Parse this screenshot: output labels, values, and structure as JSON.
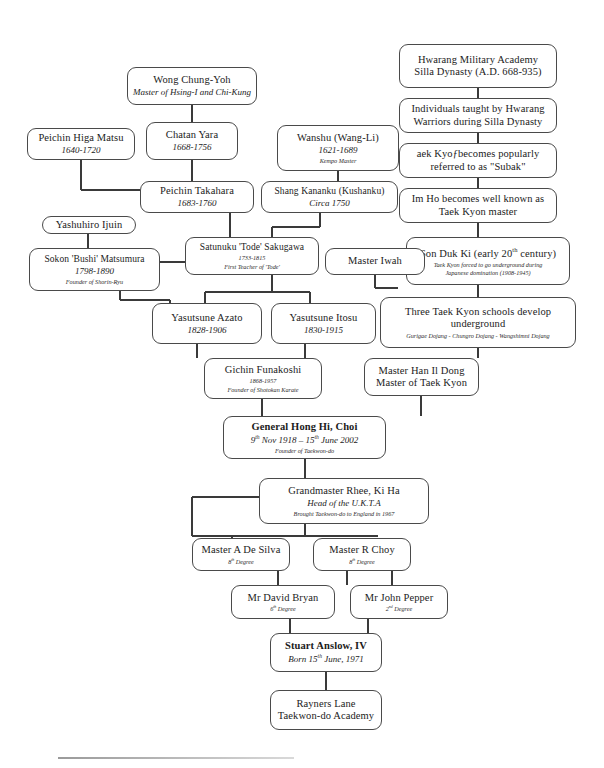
{
  "document": {
    "title": "Taekwon-do Lineage Chart",
    "type": "lineage-tree"
  },
  "nodes": {
    "hwarang_academy": {
      "line1": "Hwarang Military Academy",
      "line2": "Silla Dynasty (A.D. 668-935)"
    },
    "individuals_taught": {
      "line1": "Individuals taught by Hwarang",
      "line2": "Warriors during Silla Dynasty"
    },
    "subak": {
      "line1": "aek Kyoƒbecomes popularly",
      "line2": "referred to as \"Subak\""
    },
    "im_ho": {
      "line1": "Im Ho becomes well known as",
      "line2": "Taek Kyon master"
    },
    "son_duk_ki": {
      "line1": "Son Duk Ki (early 20th century)",
      "line2": "Taek Kyon forced to go underground during",
      "line3": "Japanese domination  (1908-1945)"
    },
    "three_schools": {
      "line1": "Three Taek Kyon schools develop",
      "line2": "underground",
      "line3": "Gurigae Dojang - Chungro Dojang - Wangshimni Dojang"
    },
    "han_il_dong": {
      "line1": "Master Han Il Dong",
      "line2": "Master of Taek Kyon"
    },
    "wong_chung_yoh": {
      "line1": "Wong Chung-Yoh",
      "line2": "Master of Hsing-I and Chi-Kung"
    },
    "higa_matsu": {
      "line1": "Peichin Higa Matsu",
      "line2": "1640-1720"
    },
    "chatan_yara": {
      "line1": "Chatan Yara",
      "line2": "1668-1756"
    },
    "wanshu": {
      "line1": "Wanshu (Wang-Li)",
      "line2": "1621-1689",
      "line3": "Kempo Master"
    },
    "takahara": {
      "line1": "Peichin Takahara",
      "line2": "1683-1760"
    },
    "shang_kananku": {
      "line1": "Shang Kananku (Kushanku)",
      "line2": "Circa 1750"
    },
    "yashuhiro_ijuin": {
      "line1": "Yashuhiro Ijuin"
    },
    "sakugawa": {
      "line1": "Satunuku 'Tode' Sakugawa",
      "line2": "1733-1815",
      "line3": "First Teacher of 'Tode'"
    },
    "master_iwah": {
      "line1": "Master Iwah"
    },
    "matsumura": {
      "line1": "Sokon 'Bushi' Matsumura",
      "line2": "1798-1890",
      "line3": "Founder of Shorin-Ryu"
    },
    "azato": {
      "line1": "Yasutsune Azato",
      "line2": "1828-1906"
    },
    "itosu": {
      "line1": "Yasutsune Itosu",
      "line2": "1830-1915"
    },
    "funakoshi": {
      "line1": "Gichin Funakoshi",
      "line2": "1868-1957",
      "line3": "Founder of Shotokan Karate"
    },
    "general_choi": {
      "line1": "General Hong Hi, Choi",
      "line2": "9th Nov 1918 – 15th June 2002",
      "line3": "Founder of Taekwon-do"
    },
    "rhee_ki_ha": {
      "line1": "Grandmaster Rhee, Ki Ha",
      "line2": "Head of the U.K.T.A",
      "line3": "Brought Taekwon-do to England in 1967"
    },
    "de_silva": {
      "line1": "Master A De Silva",
      "line2": "8th Degree"
    },
    "r_choy": {
      "line1": "Master R Choy",
      "line2": "8th Degree"
    },
    "david_bryan": {
      "line1": "Mr David Bryan",
      "line2": "6th Degree"
    },
    "john_pepper": {
      "line1": "Mr John Pepper",
      "line2": "2nd Degree"
    },
    "stuart_anslow": {
      "line1": "Stuart Anslow, IV",
      "line2": "Born 15th June, 1971"
    },
    "rayners_lane": {
      "line1": "Rayners Lane",
      "line2": "Taekwon-do Academy"
    }
  },
  "style": {
    "border_color": "#4a4a4a",
    "line_color": "#3a3a3a",
    "background": "#ffffff"
  }
}
